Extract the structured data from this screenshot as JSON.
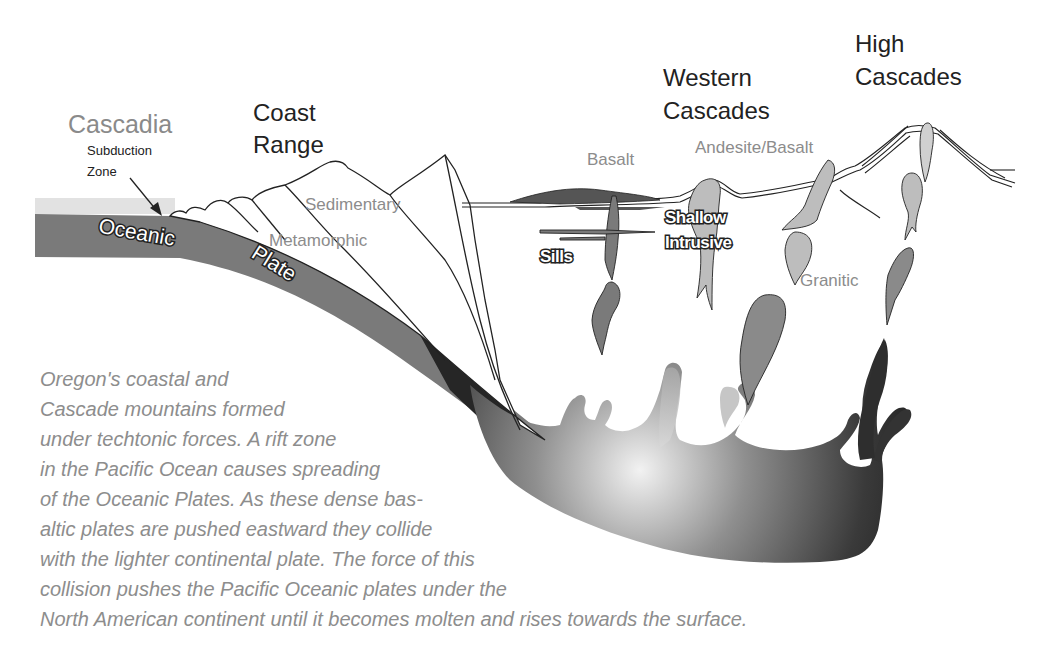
{
  "labels": {
    "cascadia": "Cascadia",
    "subduction_line1": "Subduction",
    "subduction_line2": "Zone",
    "coast_line1": "Coast",
    "coast_line2": "Range",
    "western_line1": "Western",
    "western_line2": "Cascades",
    "high_line1": "High",
    "high_line2": "Cascades",
    "sedimentary": "Sedimentary",
    "metamorphic": "Metamorphic",
    "basalt": "Basalt",
    "andesite_basalt": "Andesite/Basalt",
    "shallow": "Shallow",
    "intrusive": "Intrusive",
    "sills": "Sills",
    "granitic": "Granitic",
    "oceanic": "Oceanic",
    "plate": "Plate"
  },
  "caption": {
    "lines": [
      "Oregon's coastal and",
      "Cascade mountains formed",
      "under techtonic forces. A rift zone",
      "in the Pacific Ocean causes spreading",
      "of the Oceanic Plates. As these dense bas-",
      "altic plates are pushed eastward they collide",
      "with the lighter continental plate. The force of this",
      "collision pushes the Pacific Oceanic plates under the",
      "North American continent until it becomes molten and rises towards the surface."
    ]
  },
  "colors": {
    "plate": "#7a7a7a",
    "magma_dark": "#2a2a2a",
    "intrusion_light": "#bdbdbd",
    "intrusion_mid": "#8a8a8a",
    "text_gray": "#8d8d8d",
    "text_dark": "#222222"
  }
}
